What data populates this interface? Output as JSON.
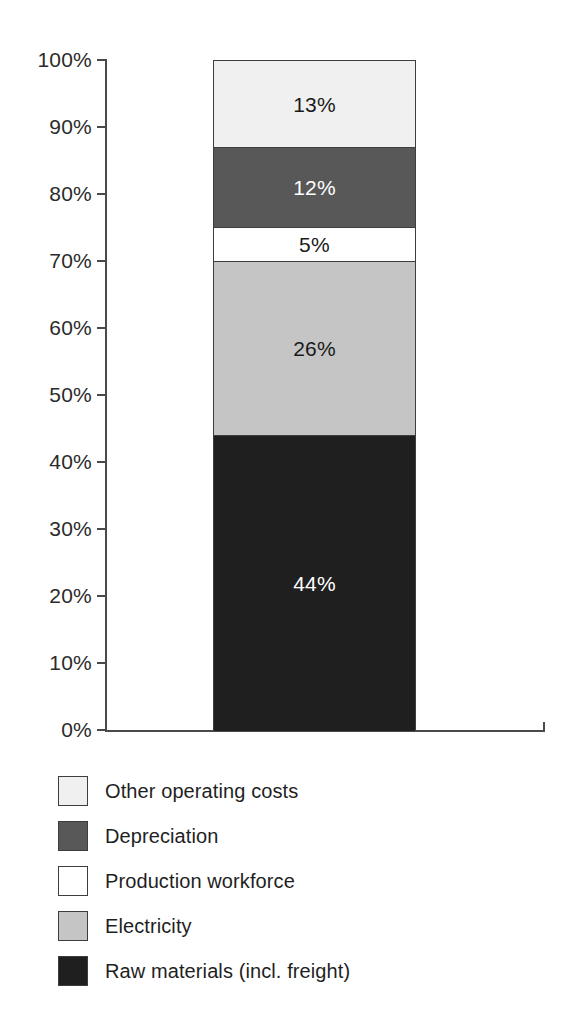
{
  "chart_data": {
    "type": "bar",
    "title": "",
    "subtitle": "",
    "xlabel": "",
    "ylabel": "",
    "stacked": true,
    "orientation": "vertical",
    "grid": false,
    "legend_position": "bottom-left",
    "categories": [
      ""
    ],
    "ylim": [
      0,
      100
    ],
    "y_ticks": [
      "0%",
      "10%",
      "20%",
      "30%",
      "40%",
      "50%",
      "60%",
      "70%",
      "80%",
      "90%",
      "100%"
    ],
    "y_tick_values": [
      0,
      10,
      20,
      30,
      40,
      50,
      60,
      70,
      80,
      90,
      100
    ],
    "series": [
      {
        "name": "Other operating costs",
        "values": [
          13
        ],
        "data_label": "13%",
        "color": "#f0f0f0",
        "label_color": "#1a1a1a"
      },
      {
        "name": "Depreciation",
        "values": [
          12
        ],
        "data_label": "12%",
        "color": "#585858",
        "label_color": "#ffffff"
      },
      {
        "name": "Production workforce",
        "values": [
          5
        ],
        "data_label": "5%",
        "color": "#ffffff",
        "label_color": "#1a1a1a"
      },
      {
        "name": "Electricity",
        "values": [
          26
        ],
        "data_label": "26%",
        "color": "#c5c5c5",
        "label_color": "#1a1a1a"
      },
      {
        "name": "Raw materials (incl. freight)",
        "values": [
          44
        ],
        "data_label": "44%",
        "color": "#1f1f1f",
        "label_color": "#ffffff"
      }
    ]
  },
  "axis": {
    "ticks": [
      {
        "label": "100%"
      },
      {
        "label": "90%"
      },
      {
        "label": "80%"
      },
      {
        "label": "70%"
      },
      {
        "label": "60%"
      },
      {
        "label": "50%"
      },
      {
        "label": "40%"
      },
      {
        "label": "30%"
      },
      {
        "label": "20%"
      },
      {
        "label": "10%"
      },
      {
        "label": "0%"
      }
    ]
  },
  "legend": {
    "items": [
      {
        "label": "Other operating costs"
      },
      {
        "label": "Depreciation"
      },
      {
        "label": "Production workforce"
      },
      {
        "label": "Electricity"
      },
      {
        "label": "Raw materials (incl. freight)"
      }
    ]
  }
}
